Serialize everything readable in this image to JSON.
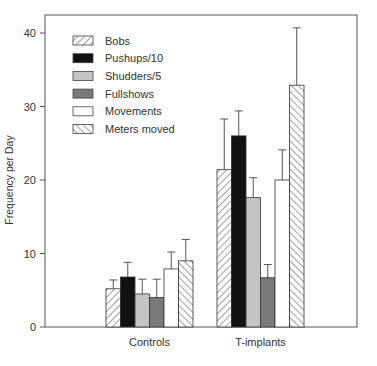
{
  "chart_data": {
    "type": "bar",
    "title": "",
    "xlabel": "",
    "ylabel": "Frequency per Day",
    "ylim": [
      0,
      42
    ],
    "yticks": [
      0,
      10,
      20,
      30,
      40
    ],
    "grid": false,
    "legend_position": "upper-left inside",
    "categories": [
      "Controls",
      "T-implants"
    ],
    "series": [
      {
        "name": "Bobs",
        "pattern": "hatch-backslash",
        "values": [
          5.2,
          21.4
        ],
        "errors": [
          1.2,
          6.9
        ]
      },
      {
        "name": "Pushups/10",
        "pattern": "solid-black",
        "values": [
          6.8,
          26.0
        ],
        "errors": [
          2.0,
          3.4
        ]
      },
      {
        "name": "Shudders/5",
        "pattern": "solid-lightgray",
        "values": [
          4.5,
          17.6
        ],
        "errors": [
          2.0,
          2.7
        ]
      },
      {
        "name": "Fullshows",
        "pattern": "solid-darkgray",
        "values": [
          4.0,
          6.7
        ],
        "errors": [
          2.5,
          1.8
        ]
      },
      {
        "name": "Movements",
        "pattern": "solid-white",
        "values": [
          7.9,
          20.0
        ],
        "errors": [
          2.3,
          4.1
        ]
      },
      {
        "name": "Meters moved",
        "pattern": "hatch-slash",
        "values": [
          9.0,
          32.9
        ],
        "errors": [
          2.9,
          7.8
        ]
      }
    ]
  },
  "colors": {
    "black": "#111111",
    "lightgray": "#c4c4c4",
    "darkgray": "#7a7a7a",
    "white": "#ffffff",
    "frame": "#555555"
  }
}
